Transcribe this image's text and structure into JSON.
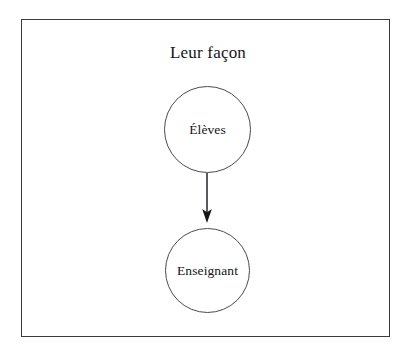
{
  "diagram": {
    "title": "Leur façon",
    "frame": {
      "border_color": "#3a3a42",
      "background_color": "#ffffff"
    },
    "nodes": [
      {
        "id": "eleves",
        "label": "Élèves",
        "shape": "circle",
        "border_color": "#4a4a52",
        "fill_color": "#ffffff"
      },
      {
        "id": "enseignant",
        "label": "Enseignant",
        "shape": "circle",
        "border_color": "#4a4a52",
        "fill_color": "#ffffff"
      }
    ],
    "edges": [
      {
        "id": "eleves-to-enseignant",
        "from": "eleves",
        "to": "enseignant",
        "direction": "down",
        "arrowhead": "filled",
        "color": "#15151a"
      }
    ],
    "text_color": "#15151a"
  }
}
